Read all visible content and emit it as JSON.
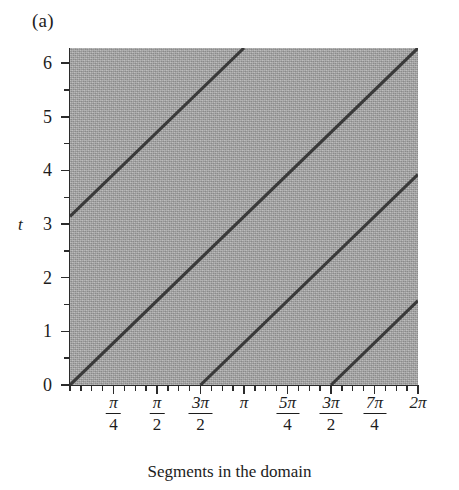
{
  "panel": {
    "letter": "(a)"
  },
  "caption": {
    "text": "Segments in the domain"
  },
  "axes": {
    "y_title": "t",
    "y_ticks": [
      "0",
      "1",
      "2",
      "3",
      "4",
      "5",
      "6"
    ],
    "x_tick_labels": [
      {
        "kind": "fraction",
        "num": "π",
        "den": "4",
        "text": "π/4"
      },
      {
        "kind": "fraction",
        "num": "π",
        "den": "2",
        "text": "π/2"
      },
      {
        "kind": "fraction",
        "num": "3π",
        "den": "2",
        "text": "3π/2"
      },
      {
        "kind": "plain",
        "text": "π"
      },
      {
        "kind": "fraction",
        "num": "5π",
        "den": "4",
        "text": "5π/4"
      },
      {
        "kind": "fraction",
        "num": "3π",
        "den": "2",
        "text": "3π/2"
      },
      {
        "kind": "fraction",
        "num": "7π",
        "den": "4",
        "text": "7π/4"
      },
      {
        "kind": "plain",
        "text": "2π"
      }
    ]
  },
  "colors": {
    "field": "#ababab",
    "line": "#3a3a3a",
    "axis": "#2b2b2b",
    "text": "#1c1c1c",
    "page": "#ffffff"
  },
  "chart_data": {
    "type": "line",
    "title": "Segments in the domain",
    "panel_label": "(a)",
    "xlabel": "",
    "ylabel": "t",
    "xlim": [
      0,
      6.283185
    ],
    "ylim": [
      0,
      6.283185
    ],
    "grid": false,
    "legend": null,
    "background_shading": "uniform grey field over full domain",
    "x_tick_values": [
      0.785398,
      1.570796,
      2.356194,
      3.141593,
      3.926991,
      4.712389,
      5.497787,
      6.283185
    ],
    "x_tick_labels": [
      "π/4",
      "π/2",
      "3π/2",
      "π",
      "5π/4",
      "3π/2",
      "7π/4",
      "2π"
    ],
    "x_minor_tick_step": 0.19635,
    "y_tick_values": [
      0,
      1,
      2,
      3,
      4,
      5,
      6
    ],
    "y_minor_tick_step": 0.5,
    "series": [
      {
        "name": "characteristic-1",
        "slope": 1.0,
        "intercept": 3.141593,
        "points": [
          [
            0.0,
            3.141593
          ],
          [
            3.141593,
            6.283185
          ]
        ]
      },
      {
        "name": "characteristic-2",
        "slope": 1.0,
        "intercept": 0.0,
        "points": [
          [
            0.0,
            0.0
          ],
          [
            6.283185,
            6.283185
          ]
        ]
      },
      {
        "name": "characteristic-3",
        "slope": 1.0,
        "intercept": -2.356194,
        "points": [
          [
            2.356194,
            0.0
          ],
          [
            6.283185,
            3.926991
          ]
        ]
      },
      {
        "name": "characteristic-4",
        "slope": 1.0,
        "intercept": -4.712389,
        "points": [
          [
            4.712389,
            0.0
          ],
          [
            6.283185,
            1.570796
          ]
        ]
      }
    ]
  }
}
